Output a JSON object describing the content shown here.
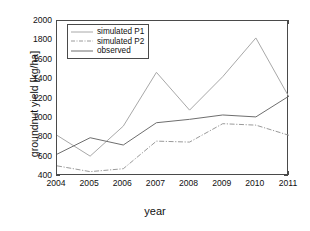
{
  "chart_data": {
    "type": "line",
    "title": "",
    "xlabel": "year",
    "ylabel": "groundnut yield [kg/ha]",
    "x": [
      2004,
      2005,
      2006,
      2007,
      2008,
      2009,
      2010,
      2011
    ],
    "xticklabels": [
      "2004",
      "2005",
      "2006",
      "2007",
      "2008",
      "2009",
      "2010",
      "2011"
    ],
    "yticklabels": [
      "2000",
      "1800",
      "1600",
      "1400",
      "1200",
      "1000",
      "800",
      "600",
      "400"
    ],
    "xlim": [
      2004,
      2011
    ],
    "ylim": [
      400,
      2000
    ],
    "ytick_step": 200,
    "grid": false,
    "legend_position": "top-left",
    "series": [
      {
        "name": "simulated P1",
        "style": "solid",
        "color": "#a8a8a8",
        "values": [
          820,
          605,
          915,
          1470,
          1080,
          1425,
          1825,
          1215
        ]
      },
      {
        "name": "simulated P2",
        "style": "dashdot",
        "color": "#9a9a9a",
        "values": [
          505,
          445,
          475,
          760,
          750,
          940,
          925,
          820
        ]
      },
      {
        "name": "observed",
        "style": "solid",
        "color": "#6e6e6e",
        "values": [
          625,
          795,
          720,
          950,
          985,
          1030,
          1010,
          1225
        ]
      }
    ]
  },
  "legend": {
    "items": [
      {
        "label": "simulated P1"
      },
      {
        "label": "simulated P2"
      },
      {
        "label": "observed"
      }
    ]
  },
  "axes": {
    "x_label": "year",
    "y_label": "groundnut yield [kg/ha]"
  },
  "colors": {
    "axis": "#4a4a4a",
    "text": "#111111",
    "background": "#ffffff",
    "series_p1": "#a8a8a8",
    "series_p2": "#9a9a9a",
    "series_observed": "#6e6e6e"
  }
}
